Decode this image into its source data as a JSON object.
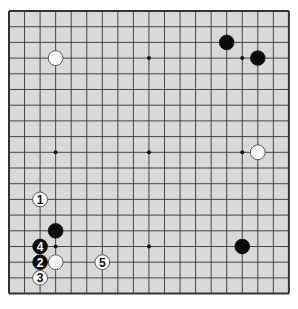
{
  "board": {
    "size": 19,
    "origin_x": 9,
    "origin_y": 11,
    "spacing_x": 15.55,
    "spacing_y": 15.7,
    "background": "#d9d9d9",
    "line_color": "#333333",
    "star_points": [
      [
        3,
        3
      ],
      [
        9,
        3
      ],
      [
        15,
        3
      ],
      [
        3,
        9
      ],
      [
        9,
        9
      ],
      [
        15,
        9
      ],
      [
        3,
        15
      ],
      [
        9,
        15
      ],
      [
        15,
        15
      ]
    ]
  },
  "stones": [
    {
      "color": "white",
      "col": 3,
      "row": 3,
      "label": ""
    },
    {
      "color": "black",
      "col": 14,
      "row": 2,
      "label": ""
    },
    {
      "color": "black",
      "col": 16,
      "row": 3,
      "label": ""
    },
    {
      "color": "white",
      "col": 16,
      "row": 9,
      "label": ""
    },
    {
      "color": "black",
      "col": 15,
      "row": 15,
      "label": ""
    },
    {
      "color": "black",
      "col": 3,
      "row": 14,
      "label": ""
    },
    {
      "color": "white",
      "col": 3,
      "row": 16,
      "label": ""
    },
    {
      "color": "white",
      "col": 2,
      "row": 12,
      "label": "1"
    },
    {
      "color": "black",
      "col": 2,
      "row": 16,
      "label": "2"
    },
    {
      "color": "white",
      "col": 2,
      "row": 17,
      "label": "3"
    },
    {
      "color": "black",
      "col": 2,
      "row": 15,
      "label": "4"
    },
    {
      "color": "white",
      "col": 6,
      "row": 16,
      "label": "5"
    }
  ]
}
